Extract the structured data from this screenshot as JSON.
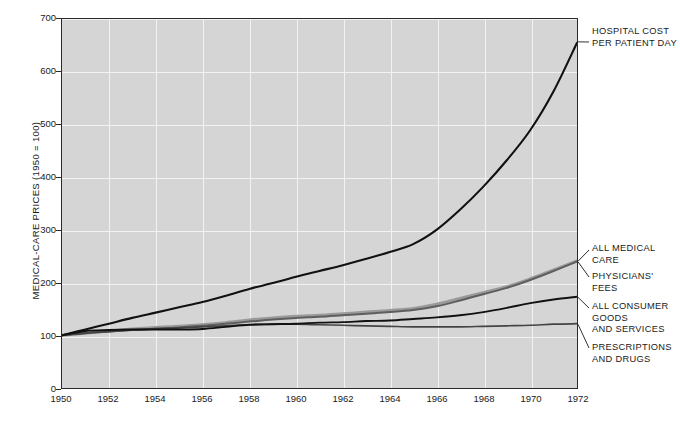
{
  "chart_data": {
    "type": "line",
    "title": "",
    "xlabel": "",
    "ylabel": "MEDICAL-CARE PRICES (1950 = 100)",
    "xlim": [
      1950,
      1972
    ],
    "ylim": [
      0,
      700
    ],
    "grid": true,
    "legend_position": "right-inline-annotations",
    "xticks": [
      "1950",
      "1952",
      "1954",
      "1956",
      "1958",
      "1960",
      "1962",
      "1964",
      "1966",
      "1968",
      "1970",
      "1972"
    ],
    "yticks": [
      "0",
      "100",
      "200",
      "300",
      "400",
      "500",
      "600",
      "700"
    ],
    "x": [
      1950,
      1951,
      1952,
      1953,
      1954,
      1955,
      1956,
      1957,
      1958,
      1959,
      1960,
      1961,
      1962,
      1963,
      1964,
      1965,
      1966,
      1967,
      1968,
      1969,
      1970,
      1971,
      1972
    ],
    "series": [
      {
        "name": "HOSPITAL COST PER PATIENT DAY",
        "color": "#111111",
        "width": 2.1,
        "values": [
          100,
          111,
          122,
          133,
          143,
          153,
          163,
          175,
          188,
          199,
          211,
          222,
          233,
          245,
          258,
          273,
          300,
          338,
          382,
          432,
          489,
          563,
          655
        ]
      },
      {
        "name": "ALL MEDICAL CARE",
        "color": "#9a9a9a",
        "width": 3.0,
        "values": [
          100,
          104,
          108,
          112,
          115,
          117,
          120,
          124,
          129,
          133,
          136,
          138,
          141,
          144,
          147,
          151,
          159,
          170,
          181,
          192,
          207,
          224,
          241
        ]
      },
      {
        "name": "PHYSICIANS' FEES",
        "color": "#5e5e5e",
        "width": 2.0,
        "values": [
          100,
          104,
          107,
          110,
          113,
          115,
          118,
          122,
          126,
          130,
          133,
          135,
          138,
          141,
          144,
          148,
          155,
          166,
          178,
          190,
          205,
          222,
          240
        ]
      },
      {
        "name": "ALL CONSUMER GOODS AND SERVICES",
        "color": "#111111",
        "width": 1.9,
        "values": [
          100,
          108,
          110,
          111,
          111,
          111,
          112,
          116,
          120,
          121,
          122,
          124,
          125,
          127,
          128,
          131,
          134,
          138,
          144,
          152,
          161,
          168,
          173
        ]
      },
      {
        "name": "PRESCRIPTIONS AND DRUGS",
        "color": "#444444",
        "width": 1.7,
        "values": [
          100,
          104,
          107,
          110,
          112,
          114,
          116,
          118,
          120,
          121,
          121,
          120,
          119,
          118,
          117,
          116,
          116,
          116,
          117,
          118,
          119,
          121,
          122
        ]
      }
    ],
    "annotations": [
      {
        "id": "hospital",
        "text": "HOSPITAL COST\nPER PATIENT DAY"
      },
      {
        "id": "allmedical",
        "text": "ALL MEDICAL CARE"
      },
      {
        "id": "physicians",
        "text": "PHYSICIANS' FEES"
      },
      {
        "id": "consumer",
        "text": "ALL CONSUMER\nGOODS\nAND SERVICES"
      },
      {
        "id": "prescription",
        "text": "PRESCRIPTIONS\nAND DRUGS"
      }
    ],
    "style": {
      "plot_background": "#d5d5d5",
      "gridline_color": "#f2f2f2",
      "frame_color": "#2b2b2b",
      "page_background": "#ffffff",
      "text_color": "#1a1a1a"
    }
  }
}
